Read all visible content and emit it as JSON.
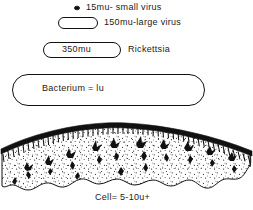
{
  "figure": {
    "caption": "Cell= 5-10u+",
    "title_present": false
  },
  "rows": [
    {
      "id": "small-virus",
      "shape": "dot",
      "shape_label": "",
      "label": "15mu- small virus",
      "size_value": 15,
      "size_unit": "mu",
      "organism": "small virus"
    },
    {
      "id": "large-virus",
      "shape": "capsule",
      "shape_label": "",
      "label": "150mu-large virus",
      "size_value": 150,
      "size_unit": "mu",
      "organism": "large virus"
    },
    {
      "id": "rickettsia",
      "shape": "capsule",
      "shape_label": "350mu",
      "label": "Rickettsia",
      "size_value": 350,
      "size_unit": "mu",
      "organism": "Rickettsia"
    },
    {
      "id": "bacterium",
      "shape": "capsule",
      "shape_label": "Bacterium = lu",
      "label": "",
      "size_value": 1,
      "size_unit": "u",
      "organism": "Bacterium"
    },
    {
      "id": "cell",
      "shape": "stippled-section",
      "shape_label": "",
      "label": "Cell= 5-10u+",
      "size_value": "5-10",
      "size_unit": "u+",
      "organism": "Cell"
    }
  ],
  "colors": {
    "ink": "#111111",
    "paper": "#ffffff",
    "stipple": "#2a2a2a"
  }
}
